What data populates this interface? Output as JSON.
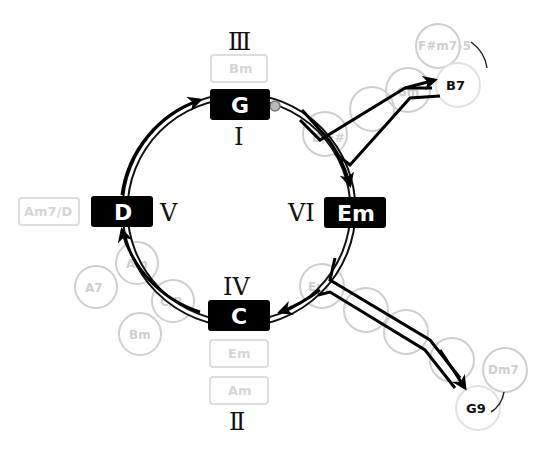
{
  "diagram": {
    "type": "chord-progression-cycle",
    "degrees": {
      "top": "Ⅲ",
      "g_below": "I",
      "right": "VI",
      "left": "V",
      "bottom_top": "IV",
      "bottom": "Ⅱ"
    },
    "main_chords": {
      "g": "G",
      "em": "Em",
      "c": "C",
      "d": "D"
    },
    "substitute_boxes": {
      "above_g": "Bm",
      "left_of_d": "Am7/D",
      "below_c_1": "Em",
      "below_c_2": "Am"
    },
    "ghost_circles": {
      "upper_branch": [
        "D/F#",
        "",
        "Gm"
      ],
      "lower_branch": [
        "Em",
        "",
        "",
        "C"
      ],
      "left_cluster": [
        "Am",
        "C/B",
        "A7",
        "Bm"
      ],
      "upper_alt": "F#m7♭5",
      "lower_alt": "Dm7"
    },
    "targets": {
      "upper": "B7",
      "lower": "G9"
    },
    "colors": {
      "main_box": "#000000",
      "main_text": "#ffffff",
      "ghost": "#d4d4d4",
      "line": "#000000"
    }
  }
}
